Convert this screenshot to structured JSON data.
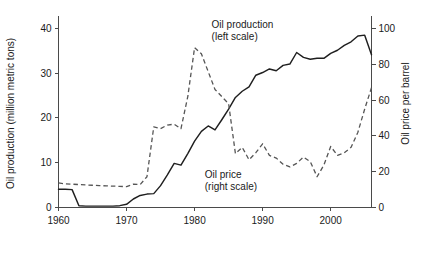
{
  "chart_data": {
    "type": "line",
    "title": "",
    "xlabel": "",
    "grid": false,
    "legend_position": "inline-annotations",
    "x_axis": {
      "ticks": [
        1960,
        1970,
        1980,
        1990,
        2000
      ],
      "tick_labels": [
        "1960",
        "1970",
        "1980",
        "1990",
        "2000"
      ],
      "xlim": [
        1960,
        2006
      ]
    },
    "left_axis": {
      "label": "Oil production (million metric tons)",
      "ticks": [
        0,
        10,
        20,
        30,
        40
      ],
      "tick_labels": [
        "0",
        "10",
        "20",
        "30",
        "40"
      ],
      "ylim": [
        0,
        42
      ]
    },
    "right_axis": {
      "label": "Oil price per barrel",
      "ticks": [
        0,
        20,
        40,
        60,
        80,
        100
      ],
      "tick_labels": [
        "0",
        "20",
        "40",
        "60",
        "80",
        "100"
      ],
      "ylim": [
        0,
        105
      ]
    },
    "annotations": [
      {
        "name": "oil-production-annotation",
        "line1": "Oil production",
        "line2": "(left scale)",
        "x": 1982.5,
        "y_px": 28
      },
      {
        "name": "oil-price-annotation",
        "line1": "Oil price",
        "line2": "(right scale)",
        "x": 1981.5,
        "y_px": 178
      }
    ],
    "series": [
      {
        "name": "Oil production",
        "axis": "left",
        "style": "solid",
        "unit": "million metric tons",
        "color": "#1f1f1f",
        "x": [
          1960,
          1961,
          1962,
          1963,
          1964,
          1965,
          1966,
          1967,
          1968,
          1969,
          1970,
          1971,
          1972,
          1973,
          1974,
          1975,
          1976,
          1977,
          1978,
          1979,
          1980,
          1981,
          1982,
          1983,
          1984,
          1985,
          1986,
          1987,
          1988,
          1989,
          1990,
          1991,
          1992,
          1993,
          1994,
          1995,
          1996,
          1997,
          1998,
          1999,
          2000,
          2001,
          2002,
          2003,
          2004,
          2005,
          2006
        ],
        "values": [
          4.0,
          4.0,
          3.9,
          0.3,
          0.2,
          0.2,
          0.2,
          0.2,
          0.2,
          0.3,
          0.6,
          1.8,
          2.6,
          2.9,
          3.0,
          4.8,
          7.2,
          9.8,
          9.4,
          12.0,
          14.8,
          17.0,
          18.2,
          17.3,
          19.6,
          22.0,
          24.6,
          26.0,
          27.0,
          29.6,
          30.2,
          31.0,
          30.6,
          31.8,
          32.1,
          34.7,
          33.6,
          33.2,
          33.4,
          33.4,
          34.5,
          35.2,
          36.3,
          37.1,
          38.4,
          38.6,
          34.2
        ]
      },
      {
        "name": "Oil price",
        "axis": "right",
        "style": "dashed",
        "unit": "price per barrel",
        "color": "#555555",
        "x": [
          1960,
          1961,
          1962,
          1963,
          1964,
          1965,
          1966,
          1967,
          1968,
          1969,
          1970,
          1971,
          1972,
          1973,
          1974,
          1975,
          1976,
          1977,
          1978,
          1979,
          1980,
          1981,
          1982,
          1983,
          1984,
          1985,
          1986,
          1987,
          1988,
          1989,
          1990,
          1991,
          1992,
          1993,
          1994,
          1995,
          1996,
          1997,
          1998,
          1999,
          2000,
          2001,
          2002,
          2003,
          2004,
          2005,
          2006
        ],
        "values": [
          13.5,
          13.0,
          12.8,
          12.6,
          12.4,
          12.2,
          12.0,
          11.9,
          11.7,
          11.6,
          11.4,
          12.8,
          12.6,
          17.0,
          45.0,
          44.0,
          46.0,
          46.5,
          44.0,
          62.0,
          89.5,
          86.0,
          76.0,
          66.0,
          62.0,
          58.0,
          30.0,
          33.5,
          26.5,
          30.5,
          35.5,
          29.0,
          27.5,
          24.0,
          22.5,
          24.5,
          28.0,
          25.5,
          17.0,
          23.5,
          34.0,
          29.0,
          30.5,
          33.5,
          42.0,
          55.0,
          67.0
        ]
      }
    ]
  }
}
